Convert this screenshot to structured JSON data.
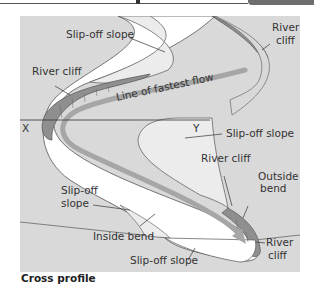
{
  "caption": "Cross profile",
  "labels": {
    "slip_off_top": "Slip-off slope",
    "river_cliff_top_right_1": "River",
    "river_cliff_top_right_2": "cliff",
    "river_cliff_left": "River cliff",
    "line_fastest_flow": "Line of fastest flow",
    "x_marker": "X",
    "y_marker": "Y",
    "slip_off_mid_right": "Slip-off slope",
    "river_cliff_mid": "River cliff",
    "outside_bend_1": "Outside",
    "outside_bend_2": "bend",
    "slip_off_left_1": "Slip-off",
    "slip_off_left_2": "slope",
    "inside_bend": "Inside bend",
    "river_cliff_bottom_1": "River",
    "river_cliff_bottom_2": "cliff",
    "slip_off_bottom": "Slip-off slope"
  },
  "colors": {
    "background_land": "#d9d9d9",
    "river_water": "#ffffff",
    "slip_off_fill": "#ececec",
    "river_cliff_fill": "#8f8f8f",
    "flow_arrow": "#a6a6a6",
    "outline": "#555555"
  }
}
